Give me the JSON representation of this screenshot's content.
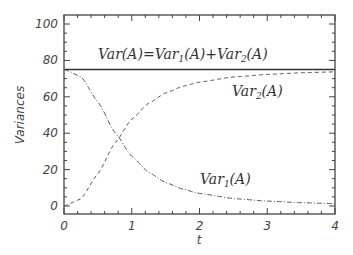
{
  "chart_data": {
    "type": "line",
    "title": "",
    "xlabel": "t",
    "ylabel": "Variances",
    "xlim": [
      0,
      4
    ],
    "ylim": [
      0,
      100
    ],
    "xticks": [
      0,
      1,
      2,
      3,
      4
    ],
    "yticks": [
      0,
      20,
      40,
      60,
      80,
      100
    ],
    "grid": false,
    "legend": "none (inline annotations)",
    "x": [
      0,
      0.25,
      0.5,
      0.75,
      1.0,
      1.25,
      1.5,
      1.75,
      2.0,
      2.5,
      3.0,
      3.5,
      4.0
    ],
    "series": [
      {
        "name": "Var(A)=Var1(A)+Var2(A)",
        "style": "solid",
        "values": [
          75,
          75,
          75,
          75,
          75,
          75,
          75,
          75,
          75,
          75,
          75,
          75,
          75
        ]
      },
      {
        "name": "Var2(A)",
        "style": "dashed",
        "values": [
          0,
          3.9,
          17.7,
          34.5,
          47.7,
          56.5,
          62.1,
          65.7,
          68.1,
          70.9,
          72.3,
          73.2,
          73.7
        ]
      },
      {
        "name": "Var1(A)",
        "style": "dash-dot",
        "values": [
          75,
          71.1,
          57.3,
          40.5,
          27.3,
          18.5,
          12.9,
          9.3,
          6.9,
          4.1,
          2.7,
          1.8,
          1.3
        ]
      }
    ],
    "annotations": [
      {
        "text": "Var(A)=Var1(A)+Var2(A)",
        "x": 1.9,
        "y": 78
      },
      {
        "text": "Var2(A)",
        "x": 2.55,
        "y": 63
      },
      {
        "text": "Var1(A)",
        "x": 2.55,
        "y": 10
      }
    ]
  },
  "labels": {
    "xlabel": "t",
    "ylabel": "Variances",
    "xticks": [
      "0",
      "1",
      "2",
      "3",
      "4"
    ],
    "yticks": [
      "0",
      "20",
      "40",
      "60",
      "80",
      "100"
    ],
    "anno_total_prefix": "Var(A)=Var",
    "anno_total_mid": "(A)+Var",
    "anno_total_suffix": "(A)",
    "anno_var": "Var",
    "anno_paren": "(A)",
    "sub1": "1",
    "sub2": "2"
  }
}
